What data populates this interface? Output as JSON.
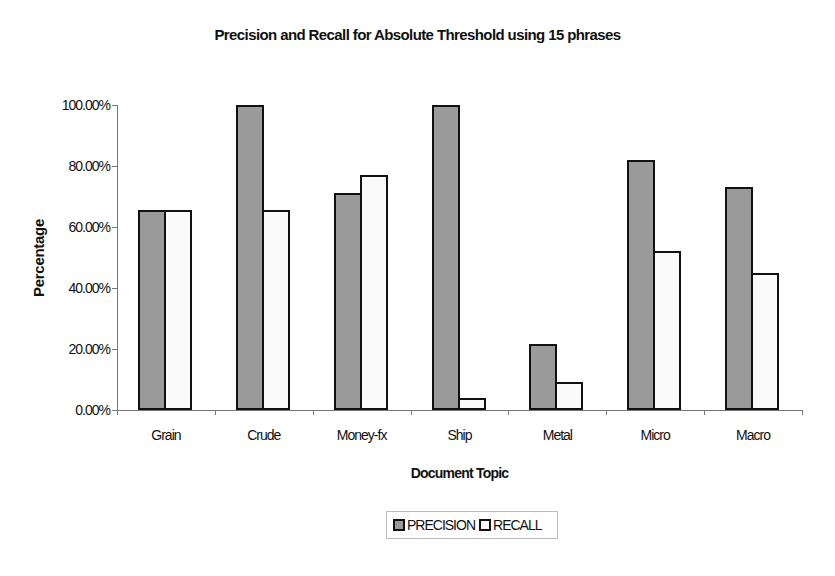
{
  "chart_data": {
    "type": "bar",
    "title": "Precision and Recall for Absolute Threshold using 15 phrases",
    "xlabel": "Document Topic",
    "ylabel": "Percentage",
    "ylim": [
      0,
      100
    ],
    "yticks": [
      "0.00%",
      "20.00%",
      "40.00%",
      "60.00%",
      "80.00%",
      "100.00%"
    ],
    "categories": [
      "Grain",
      "Crude",
      "Money-fx",
      "Ship",
      "Metal",
      "Micro",
      "Macro"
    ],
    "series": [
      {
        "name": "PRECISION",
        "color": "#9a9a9a",
        "values": [
          65.6,
          100,
          71,
          100,
          21.6,
          82,
          73
        ]
      },
      {
        "name": "RECALL",
        "color": "#fafafa",
        "values": [
          65.6,
          65.6,
          77,
          4,
          9.2,
          52,
          45
        ]
      }
    ],
    "grid": false,
    "legend_position": "bottom"
  }
}
